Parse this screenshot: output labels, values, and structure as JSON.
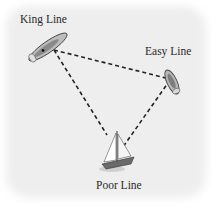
{
  "diagram": {
    "ships": [
      {
        "id": "king",
        "label": "King Line",
        "type": "ship",
        "label_pos": {
          "x": 20,
          "y": 13
        }
      },
      {
        "id": "easy",
        "label": "Easy Line",
        "type": "ship",
        "label_pos": {
          "x": 145,
          "y": 45
        }
      },
      {
        "id": "poor",
        "label": "Poor Line",
        "type": "sailboat",
        "label_pos": {
          "x": 96,
          "y": 179
        }
      }
    ],
    "connections": [
      {
        "from": "king",
        "to": "easy",
        "style": "dashed"
      },
      {
        "from": "king",
        "to": "poor",
        "style": "dashed"
      },
      {
        "from": "easy",
        "to": "poor",
        "style": "dashed"
      }
    ],
    "colors": {
      "background": "#eeeeee",
      "line": "#222222",
      "ship_hull": "#9a9a9a"
    }
  }
}
